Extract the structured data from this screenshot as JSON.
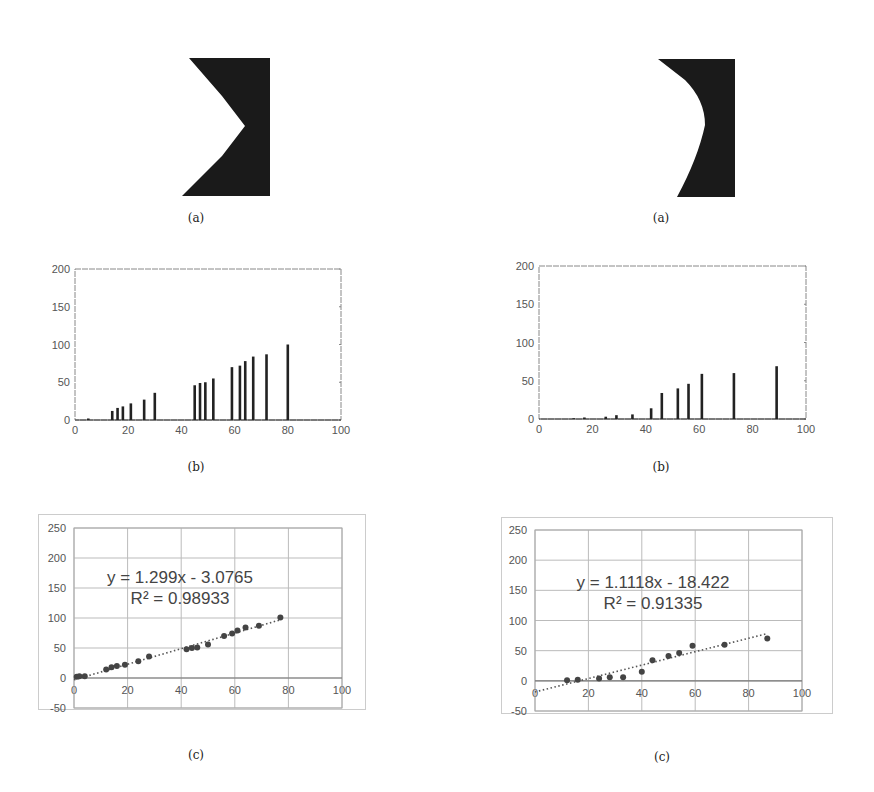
{
  "captions": {
    "left_a": "(a)",
    "left_b": "(b)",
    "left_c": "(c)",
    "right_a": "(a)",
    "right_b": "(b)",
    "right_c": "(c)"
  },
  "colors": {
    "ink": "#222222",
    "axis": "#888888",
    "grid": "#bbbbbb",
    "point": "#444444"
  },
  "chart_data": [
    {
      "id": "left_a",
      "type": "image",
      "description": "Black notch shape with V-shaped (angular) cut on left side"
    },
    {
      "id": "left_b",
      "type": "bar",
      "title": "",
      "xlabel": "",
      "ylabel": "",
      "xlim": [
        0,
        100
      ],
      "ylim": [
        0,
        200
      ],
      "xticks": [
        "0",
        "20",
        "40",
        "60",
        "80",
        "100"
      ],
      "yticks": [
        "0",
        "50",
        "100",
        "150",
        "200"
      ],
      "x": [
        5,
        14,
        16,
        18,
        21,
        26,
        30,
        45,
        47,
        49,
        52,
        59,
        62,
        64,
        67,
        72,
        80
      ],
      "values": [
        2,
        12,
        16,
        18,
        22,
        27,
        36,
        46,
        49,
        50,
        55,
        70,
        72,
        78,
        84,
        87,
        100
      ]
    },
    {
      "id": "left_c",
      "type": "scatter",
      "title": "",
      "xlim": [
        0,
        100
      ],
      "ylim": [
        -50,
        250
      ],
      "xticks": [
        "0",
        "20",
        "40",
        "60",
        "80",
        "100"
      ],
      "yticks": [
        "-50",
        "0",
        "50",
        "100",
        "150",
        "200",
        "250"
      ],
      "grid": true,
      "trendline": {
        "equation": "y = 1.299x - 3.0765",
        "r2": "R² = 0.98933",
        "slope": 1.299,
        "intercept": -3.0765,
        "style": "dotted"
      },
      "x": [
        1,
        2,
        4,
        12,
        14,
        16,
        19,
        24,
        28,
        42,
        44,
        46,
        50,
        56,
        59,
        61,
        64,
        69,
        77
      ],
      "y": [
        2,
        3,
        3,
        14,
        18,
        20,
        22,
        28,
        36,
        48,
        50,
        51,
        56,
        70,
        74,
        79,
        84,
        87,
        101
      ]
    },
    {
      "id": "right_a",
      "type": "image",
      "description": "Black notch shape with curved (rounded) cut on left side"
    },
    {
      "id": "right_b",
      "type": "bar",
      "title": "",
      "xlabel": "",
      "ylabel": "",
      "xlim": [
        0,
        100
      ],
      "ylim": [
        0,
        200
      ],
      "xticks": [
        "0",
        "20",
        "40",
        "60",
        "80",
        "100"
      ],
      "yticks": [
        "0",
        "50",
        "100",
        "150",
        "200"
      ],
      "x": [
        13,
        17,
        25,
        29,
        35,
        42,
        46,
        52,
        56,
        61,
        73,
        89
      ],
      "values": [
        1,
        2,
        3,
        5,
        6,
        14,
        34,
        40,
        46,
        59,
        60,
        69
      ]
    },
    {
      "id": "right_c",
      "type": "scatter",
      "title": "",
      "xlim": [
        0,
        100
      ],
      "ylim": [
        -50,
        250
      ],
      "xticks": [
        "0",
        "20",
        "40",
        "60",
        "80",
        "100"
      ],
      "yticks": [
        "-50",
        "0",
        "50",
        "100",
        "150",
        "200",
        "250"
      ],
      "grid": true,
      "trendline": {
        "equation": "y = 1.1118x - 18.422",
        "r2": "R² = 0.91335",
        "slope": 1.1118,
        "intercept": -18.422,
        "style": "dotted"
      },
      "x": [
        12,
        16,
        24,
        28,
        33,
        40,
        44,
        50,
        54,
        59,
        71,
        87
      ],
      "y": [
        1,
        2,
        4,
        6,
        6,
        15,
        34,
        41,
        46,
        58,
        60,
        70
      ]
    }
  ]
}
